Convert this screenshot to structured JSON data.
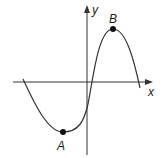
{
  "diagram": {
    "type": "function-graph",
    "axes": {
      "x_label": "x",
      "y_label": "y",
      "color": "#333333"
    },
    "curve": {
      "description": "cubic-like curve with local minimum A and local maximum B",
      "color": "#333333"
    },
    "points": [
      {
        "name": "A",
        "label": "A",
        "kind": "local minimum"
      },
      {
        "name": "B",
        "label": "B",
        "kind": "local maximum"
      }
    ]
  }
}
